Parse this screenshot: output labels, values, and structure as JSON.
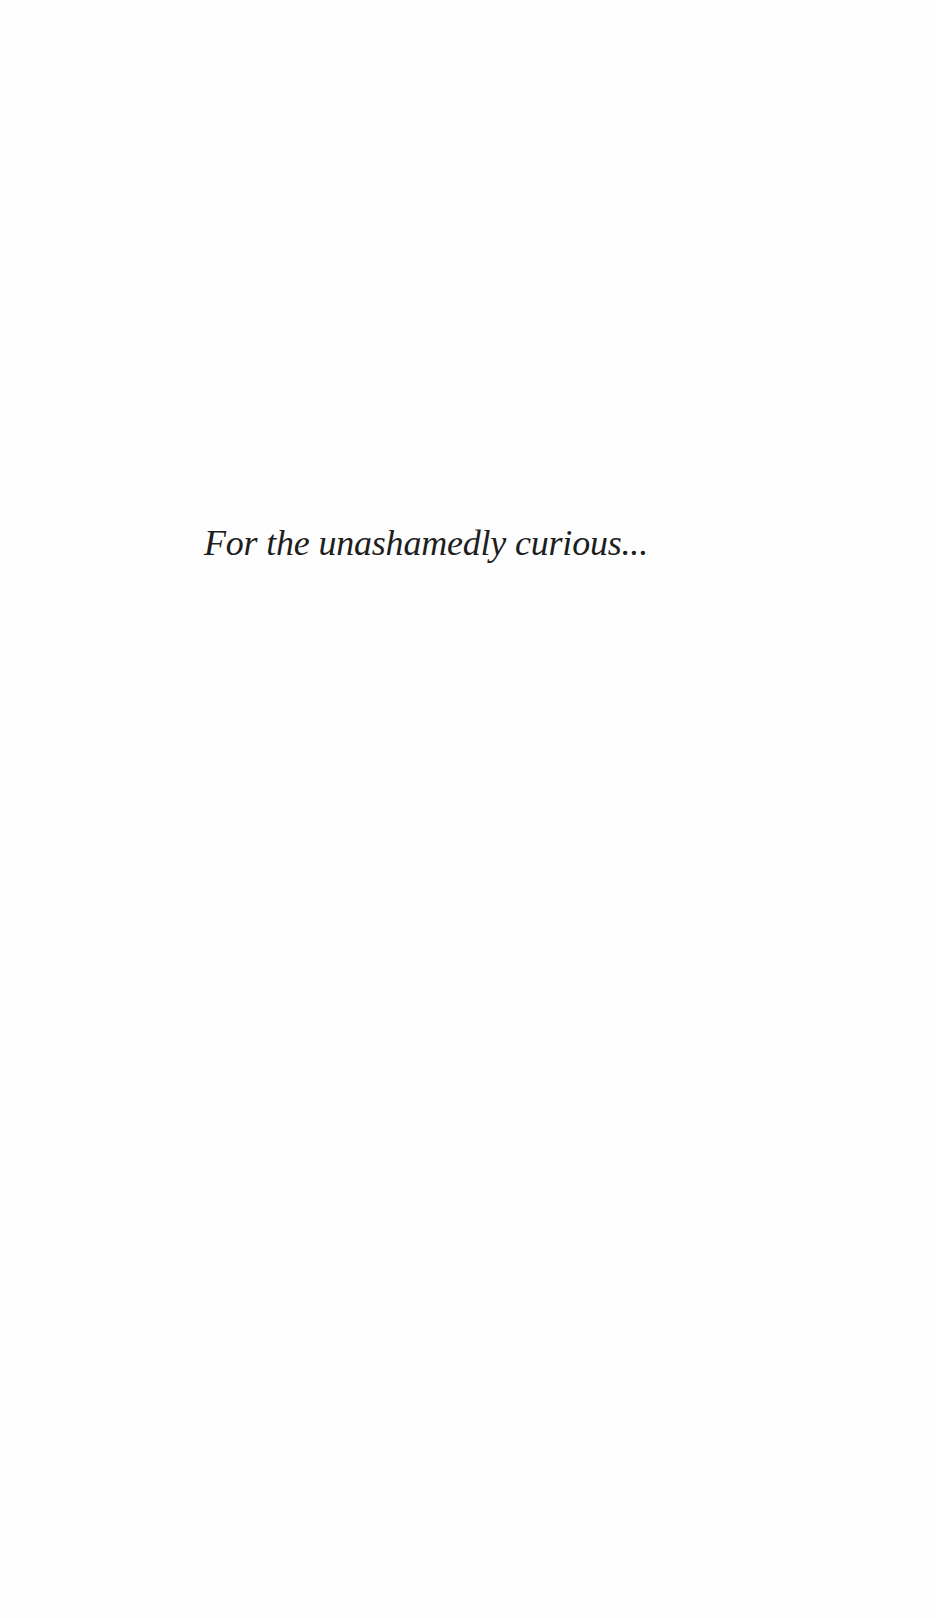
{
  "page": {
    "dedication": "For the unashamedly curious..."
  }
}
